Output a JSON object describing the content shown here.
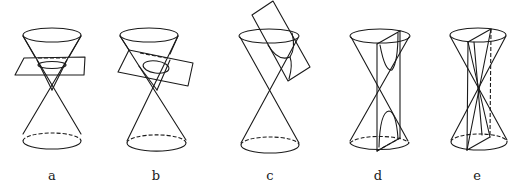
{
  "figure": {
    "panels": [
      {
        "id": "a",
        "label": "a",
        "section": "circle",
        "plane": "horizontal"
      },
      {
        "id": "b",
        "label": "b",
        "section": "ellipse",
        "plane": "tilted"
      },
      {
        "id": "c",
        "label": "c",
        "section": "parabola",
        "plane": "parallel to generator"
      },
      {
        "id": "d",
        "label": "d",
        "section": "hyperbola",
        "plane": "vertical"
      },
      {
        "id": "e",
        "label": "e",
        "section": "degenerate (intersecting lines)",
        "plane": "vertical through apex"
      }
    ],
    "colors": {
      "line": "#1a1a1a",
      "background": "#ffffff"
    }
  }
}
